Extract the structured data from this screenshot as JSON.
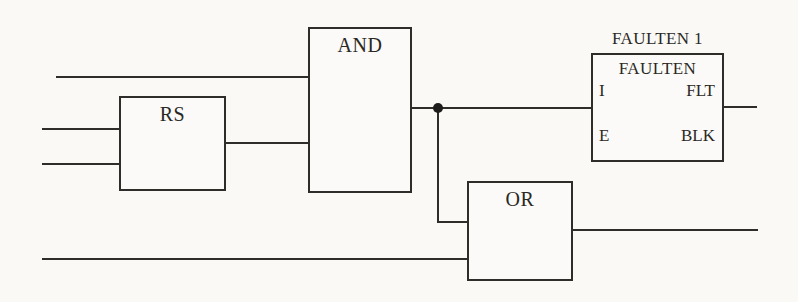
{
  "figure": {
    "background_color": "#faf9f6",
    "line_color": "#2f2d2a",
    "text_color": "#2a2824"
  },
  "blocks": {
    "rs": {
      "label": "RS"
    },
    "and": {
      "label": "AND"
    },
    "or": {
      "label": "OR"
    },
    "faulten": {
      "instance_name": "FAULTEN 1",
      "type_name": "FAULTEN",
      "ports": {
        "in_top": "I",
        "in_bottom": "E",
        "out_top": "FLT",
        "out_bottom": "BLK"
      }
    }
  }
}
